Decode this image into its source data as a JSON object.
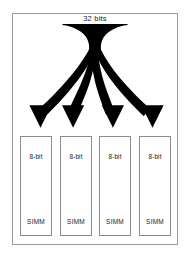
{
  "diagram": {
    "bus": {
      "label": "32 bits",
      "icon": "funnel-shape"
    },
    "arrows": {
      "count": 4,
      "icon": "curved-down-arrow",
      "color": "#000000"
    },
    "modules": [
      {
        "width_label": "8-bit",
        "name_label": "SIMM"
      },
      {
        "width_label": "8-bit",
        "name_label": "SIMM"
      },
      {
        "width_label": "8-bit",
        "name_label": "SIMM"
      },
      {
        "width_label": "8-bit",
        "name_label": "SIMM"
      }
    ],
    "colors": {
      "frame_border": "#9a9a9a",
      "module_border": "#8d8d8d",
      "ink": "#000000",
      "background": "#ffffff",
      "text": "#1b1b1b"
    }
  }
}
